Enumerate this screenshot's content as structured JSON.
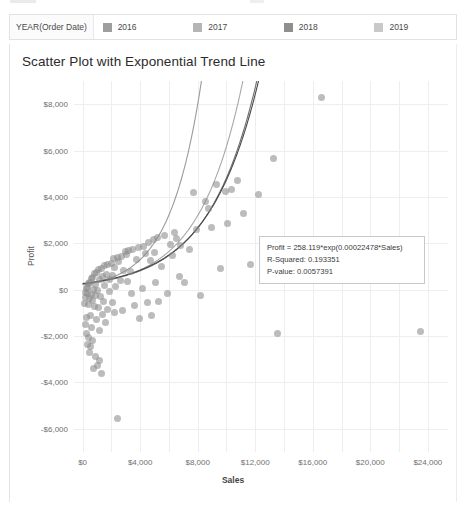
{
  "legend": {
    "title": "YEAR(Order Date)",
    "items": [
      {
        "label": "2016",
        "color": "#9e9e9e"
      },
      {
        "label": "2017",
        "color": "#b5b5b5"
      },
      {
        "label": "2018",
        "color": "#8f8f8f"
      },
      {
        "label": "2019",
        "color": "#c9c9c9"
      }
    ]
  },
  "chart_data": {
    "type": "scatter",
    "title": "Scatter Plot with Exponential Trend Line",
    "xlabel": "Sales",
    "ylabel": "Profit",
    "xlim": [
      -600,
      25400
    ],
    "ylim": [
      -7000,
      9000
    ],
    "grid": true,
    "xticks": [
      "$0",
      "$4,000",
      "$8,000",
      "$12,000",
      "$16,000",
      "$20,000",
      "$24,000"
    ],
    "xtick_values": [
      0,
      4000,
      8000,
      12000,
      16000,
      20000,
      24000
    ],
    "xgrid_values": [
      0,
      2000,
      4000,
      6000,
      8000,
      10000,
      12000,
      14000,
      16000,
      18000,
      20000,
      22000,
      24000
    ],
    "yticks": [
      "$8,000",
      "$6,000",
      "$4,000",
      "$2,000",
      "$0",
      "-$2,000",
      "-$4,000",
      "-$6,000"
    ],
    "ytick_values": [
      8000,
      6000,
      4000,
      2000,
      0,
      -2000,
      -4000,
      -6000
    ],
    "legend_position": "top",
    "marker": {
      "size": 7,
      "opacity": 0.58,
      "color": "#8c8c8c"
    },
    "annotation": {
      "equation": "Profit = 258.119*exp(0.00022478*Sales)",
      "r_squared_label": "R-Squared: 0.193351",
      "p_value_label": "P-value: 0.0057391",
      "r_squared": 0.193351,
      "p_value": 0.0057391,
      "coef_a": 258.119,
      "coef_b": 0.00022478
    },
    "trendlines": [
      {
        "name": "2016",
        "type": "exponential",
        "a": 210.0,
        "b": 0.000455,
        "color": "#9b9b9b",
        "x_end": 8300
      },
      {
        "name": "2017",
        "type": "exponential",
        "a": 228.0,
        "b": 0.00033,
        "color": "#a8a8a8",
        "x_end": 11600
      },
      {
        "name": "2018",
        "type": "exponential",
        "a": 250.0,
        "b": 0.000296,
        "color": "#6e6e6e",
        "x_end": 12700
      },
      {
        "name": "2019",
        "type": "exponential",
        "a": 266.0,
        "b": 0.000288,
        "color": "#4a4a4a",
        "x_end": 13000
      }
    ],
    "points": [
      [
        16600,
        8300
      ],
      [
        9300,
        4550
      ],
      [
        9900,
        4250
      ],
      [
        10350,
        4300
      ],
      [
        8550,
        3800
      ],
      [
        11150,
        3300
      ],
      [
        8950,
        2700
      ],
      [
        7900,
        2600
      ],
      [
        6400,
        2450
      ],
      [
        5700,
        2350
      ],
      [
        5200,
        2250
      ],
      [
        4900,
        2150
      ],
      [
        4550,
        2050
      ],
      [
        6100,
        1950
      ],
      [
        6800,
        1900
      ],
      [
        4200,
        1850
      ],
      [
        3900,
        1800
      ],
      [
        3500,
        1750
      ],
      [
        3200,
        1700
      ],
      [
        2950,
        1650
      ],
      [
        5000,
        1600
      ],
      [
        4350,
        1550
      ],
      [
        3050,
        1500
      ],
      [
        2700,
        1450
      ],
      [
        2400,
        1400
      ],
      [
        2150,
        1350
      ],
      [
        3750,
        1300
      ],
      [
        4700,
        1250
      ],
      [
        2500,
        1200
      ],
      [
        2000,
        1150
      ],
      [
        1750,
        1100
      ],
      [
        1500,
        1050
      ],
      [
        5500,
        1000
      ],
      [
        2250,
        950
      ],
      [
        1300,
        900
      ],
      [
        1100,
        860
      ],
      [
        2850,
        820
      ],
      [
        3350,
        780
      ],
      [
        6250,
        1480
      ],
      [
        950,
        740
      ],
      [
        800,
        700
      ],
      [
        1650,
        660
      ],
      [
        2100,
        620
      ],
      [
        1400,
        580
      ],
      [
        700,
        540
      ],
      [
        600,
        500
      ],
      [
        1200,
        460
      ],
      [
        1850,
        420
      ],
      [
        2600,
        380
      ],
      [
        3100,
        340
      ],
      [
        500,
        300
      ],
      [
        420,
        260
      ],
      [
        900,
        220
      ],
      [
        1550,
        180
      ],
      [
        2300,
        140
      ],
      [
        350,
        100
      ],
      [
        280,
        60
      ],
      [
        760,
        20
      ],
      [
        1050,
        -20
      ],
      [
        1900,
        -60
      ],
      [
        230,
        -100
      ],
      [
        330,
        -150
      ],
      [
        620,
        -200
      ],
      [
        880,
        -250
      ],
      [
        1250,
        -300
      ],
      [
        190,
        -350
      ],
      [
        450,
        -400
      ],
      [
        700,
        -450
      ],
      [
        1450,
        -500
      ],
      [
        2050,
        -550
      ],
      [
        160,
        -600
      ],
      [
        380,
        -660
      ],
      [
        820,
        -720
      ],
      [
        1100,
        -780
      ],
      [
        1700,
        -840
      ],
      [
        5900,
        -150
      ],
      [
        6700,
        550
      ],
      [
        7400,
        1750
      ],
      [
        4500,
        -550
      ],
      [
        3600,
        -700
      ],
      [
        2750,
        -900
      ],
      [
        2200,
        -980
      ],
      [
        1350,
        -1050
      ],
      [
        520,
        -1100
      ],
      [
        260,
        -1200
      ],
      [
        940,
        -1300
      ],
      [
        1600,
        -1400
      ],
      [
        3950,
        -1250
      ],
      [
        4800,
        -1100
      ],
      [
        5300,
        -500
      ],
      [
        210,
        -1500
      ],
      [
        640,
        -1650
      ],
      [
        1150,
        -1750
      ],
      [
        290,
        -1900
      ],
      [
        440,
        -2050
      ],
      [
        700,
        -2200
      ],
      [
        560,
        -2450
      ],
      [
        480,
        -2700
      ],
      [
        900,
        -2900
      ],
      [
        1150,
        -3050
      ],
      [
        1000,
        -3250
      ],
      [
        760,
        -3400
      ],
      [
        1300,
        -3600
      ],
      [
        330,
        -2350
      ],
      [
        2400,
        -5550
      ],
      [
        23500,
        -1800
      ],
      [
        13300,
        5650
      ],
      [
        13900,
        700
      ],
      [
        13550,
        -1900
      ],
      [
        12900,
        1700
      ],
      [
        11700,
        1100
      ],
      [
        14200,
        2050
      ],
      [
        7100,
        300
      ],
      [
        8200,
        -250
      ],
      [
        9600,
        900
      ],
      [
        5050,
        320
      ],
      [
        4150,
        40
      ],
      [
        3400,
        -180
      ],
      [
        6550,
        2200
      ],
      [
        7700,
        4200
      ],
      [
        10800,
        4700
      ],
      [
        12200,
        4100
      ],
      [
        8750,
        3500
      ],
      [
        10100,
        2850
      ]
    ]
  }
}
